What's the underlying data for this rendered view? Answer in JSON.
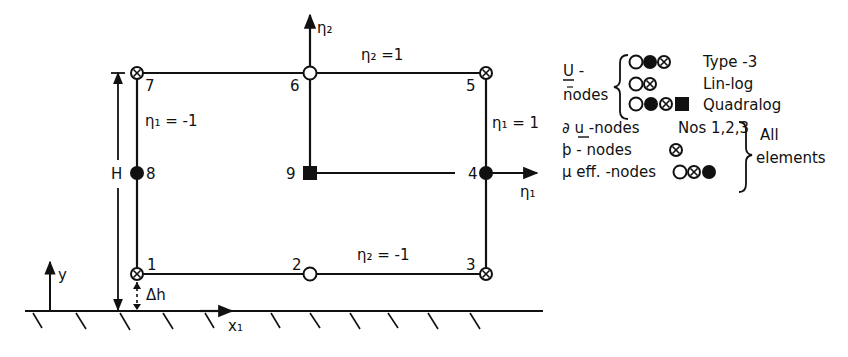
{
  "diagram": {
    "colors": {
      "ink": "#111111",
      "background": "#ffffff"
    },
    "nodes": [
      {
        "id": "1",
        "label": "1",
        "symbol": "cross-circle",
        "x": 137,
        "y": 274
      },
      {
        "id": "2",
        "label": "2",
        "symbol": "open-circle",
        "x": 310,
        "y": 274
      },
      {
        "id": "3",
        "label": "3",
        "symbol": "cross-circle",
        "x": 486,
        "y": 274
      },
      {
        "id": "4",
        "label": "4",
        "symbol": "filled-circle",
        "x": 486,
        "y": 173
      },
      {
        "id": "5",
        "label": "5",
        "symbol": "cross-circle",
        "x": 486,
        "y": 73
      },
      {
        "id": "6",
        "label": "6",
        "symbol": "open-circle",
        "x": 310,
        "y": 73
      },
      {
        "id": "7",
        "label": "7",
        "symbol": "cross-circle",
        "x": 137,
        "y": 73
      },
      {
        "id": "8",
        "label": "8",
        "symbol": "filled-circle",
        "x": 137,
        "y": 173
      },
      {
        "id": "9",
        "label": "9",
        "symbol": "filled-square",
        "x": 310,
        "y": 173
      }
    ],
    "edge_labels": {
      "top": "η₂ =1",
      "bottom": "η₂ = -1",
      "left": "η₁ = -1",
      "right": "η₁ = 1"
    },
    "axes": {
      "eta1": "η₁",
      "eta2": "η₂",
      "x1": "x₁",
      "y": "y"
    },
    "dimensions": {
      "height": "H",
      "offset": "Δh"
    },
    "legend": {
      "u_nodes_label_line1": "U -",
      "u_nodes_label_line2": "nodes",
      "rows": [
        {
          "symbols": [
            "open-circle",
            "filled-circle",
            "cross-circle"
          ],
          "text": "Type -3"
        },
        {
          "symbols": [
            "open-circle",
            "cross-circle"
          ],
          "text": "Lin-log"
        },
        {
          "symbols": [
            "open-circle",
            "filled-circle",
            "cross-circle",
            "filled-square"
          ],
          "text": "Quadralog"
        }
      ],
      "du_nodes": {
        "label": "∂ u -nodes",
        "value": "Nos 1,2,3"
      },
      "p_nodes": {
        "label": "þ - nodes",
        "symbols": [
          "cross-circle"
        ]
      },
      "mu_nodes": {
        "label": "μ eff. -nodes",
        "symbols": [
          "open-circle",
          "cross-circle",
          "filled-circle"
        ]
      },
      "all_elements_line1": "All",
      "all_elements_line2": "elements"
    }
  }
}
